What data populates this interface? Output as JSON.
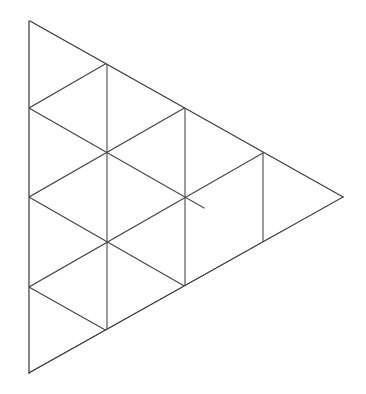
{
  "figure": {
    "type": "line-drawing",
    "background_color": "#ffffff",
    "stroke_color": "#4a4a4a",
    "outline_color": "#3f3f3f",
    "stroke_width": 1.1,
    "canvas": {
      "width": 366,
      "height": 394
    }
  },
  "geometry": {
    "description": "A large triangle with a vertical left edge, apex at top-left, a rightward point, subdivided into a grid of equilateral-style triangles. Columns of vertices at x = 29, 107, 185, 263, 343.",
    "column_x": [
      29,
      107,
      185,
      263,
      343
    ],
    "row_step_y": 45,
    "vertices": [
      {
        "name": "apex-top-left",
        "x": 30,
        "y": 21
      },
      {
        "name": "left-edge-v1",
        "x": 29,
        "y": 108
      },
      {
        "name": "left-edge-v2",
        "x": 29,
        "y": 197
      },
      {
        "name": "left-edge-v3",
        "x": 29,
        "y": 287
      },
      {
        "name": "bottom-left",
        "x": 29,
        "y": 373
      },
      {
        "name": "inner-a",
        "x": 107,
        "y": 63
      },
      {
        "name": "inner-b",
        "x": 107,
        "y": 152
      },
      {
        "name": "inner-c",
        "x": 107,
        "y": 242
      },
      {
        "name": "inner-d",
        "x": 107,
        "y": 331
      },
      {
        "name": "inner-e",
        "x": 185,
        "y": 108
      },
      {
        "name": "inner-f",
        "x": 185,
        "y": 197
      },
      {
        "name": "inner-g",
        "x": 185,
        "y": 287
      },
      {
        "name": "inner-h",
        "x": 263,
        "y": 153
      },
      {
        "name": "inner-i",
        "x": 263,
        "y": 242
      },
      {
        "name": "right-tip",
        "x": 343,
        "y": 197
      }
    ],
    "outline_path": "M 30,21 L 343,197 L 29,373 L 29,21 Z",
    "segments": [
      {
        "name": "left-edge-vertical",
        "x1": 29,
        "y1": 21,
        "x2": 29,
        "y2": 373
      },
      {
        "name": "upper-right-edge",
        "x1": 30,
        "y1": 21,
        "x2": 343,
        "y2": 197
      },
      {
        "name": "lower-right-edge",
        "x1": 343,
        "y1": 197,
        "x2": 29,
        "y2": 373
      },
      {
        "name": "vertical-col1",
        "x1": 107,
        "y1": 63,
        "x2": 107,
        "y2": 331
      },
      {
        "name": "vertical-col2",
        "x1": 185,
        "y1": 108,
        "x2": 185,
        "y2": 287
      },
      {
        "name": "vertical-col3",
        "x1": 263,
        "y1": 153,
        "x2": 263,
        "y2": 242
      },
      {
        "name": "diag-down-1",
        "x1": 29,
        "y1": 108,
        "x2": 185,
        "y2": 197
      },
      {
        "name": "diag-down-2",
        "x1": 29,
        "y1": 197,
        "x2": 263,
        "y2": 331
      },
      {
        "name": "diag-down-3",
        "x1": 29,
        "y1": 287,
        "x2": 107,
        "y2": 331
      },
      {
        "name": "diag-up-1",
        "x1": 29,
        "y1": 108,
        "x2": 185,
        "y2": 18
      },
      {
        "name": "diag-up-2",
        "x1": 29,
        "y1": 197,
        "x2": 263,
        "y2": 63
      },
      {
        "name": "diag-up-3",
        "x1": 29,
        "y1": 287,
        "x2": 263,
        "y2": 153
      },
      {
        "name": "diag-up-4",
        "x1": 29,
        "y1": 373,
        "x2": 263,
        "y2": 242
      }
    ]
  }
}
